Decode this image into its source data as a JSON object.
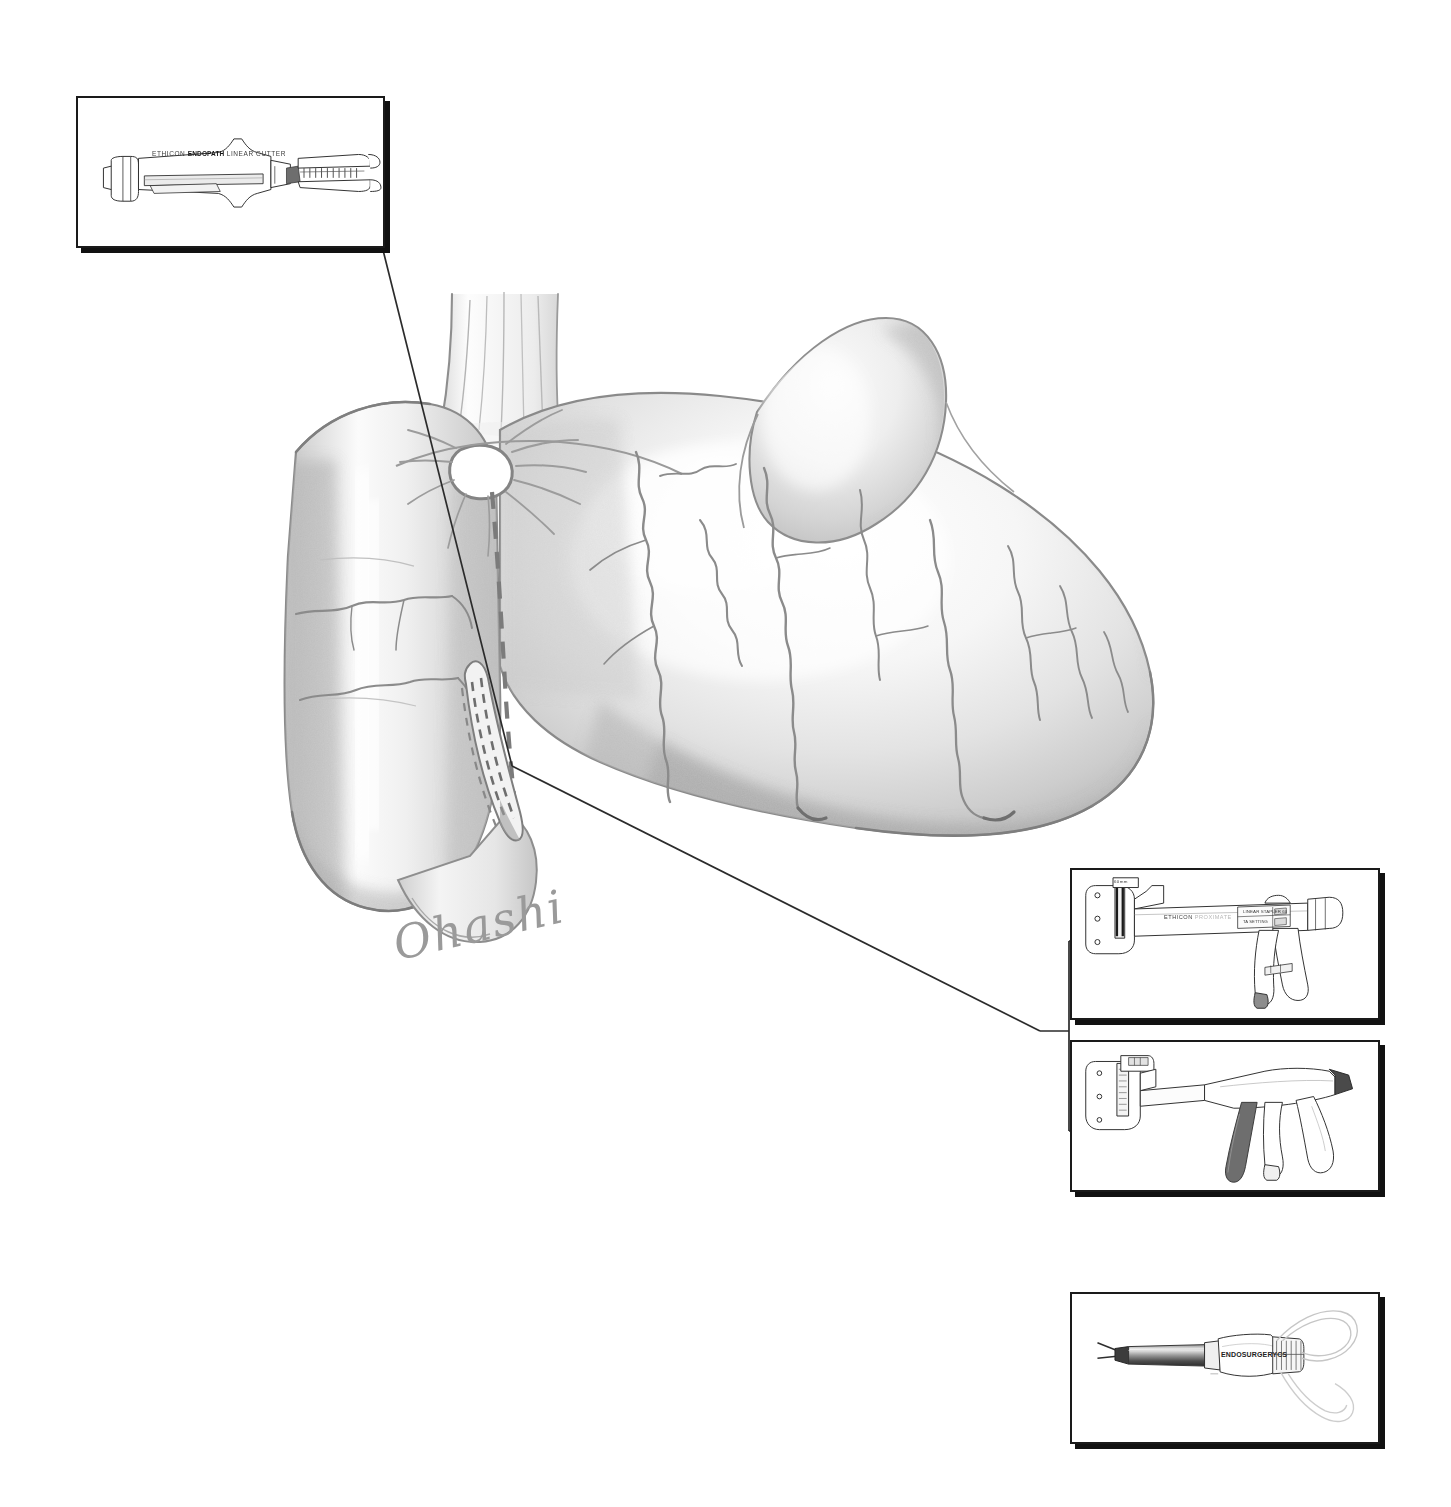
{
  "figure": {
    "background_color": "#ffffff",
    "ink_color": "#5a5a5a",
    "line_color": "#1a1a1a"
  },
  "anatomy": {
    "label": "anatomical-illustration",
    "structures": [
      {
        "name": "esophagus",
        "note": "longitudinal muscle striations entering cardia"
      },
      {
        "name": "gastric-conduit",
        "note": "tubularized lesser curvature limb, left"
      },
      {
        "name": "stoma-opening",
        "note": "circular anastomotic opening with radiating mucosal folds"
      },
      {
        "name": "stomach-body",
        "note": "greater curvature fundus and body, right"
      },
      {
        "name": "gastroepiploic-vessels",
        "note": "tortuous vessel arcade along greater curvature"
      },
      {
        "name": "staple-line",
        "note": "double parallel staple rows on divided margin"
      },
      {
        "name": "dashed-resection-line",
        "note": "dashed transection plane from cardia to antrum"
      },
      {
        "name": "duodenum",
        "note": "distal outflow segment"
      }
    ]
  },
  "signature": {
    "name": "artist-signature",
    "text": "Ohashi"
  },
  "insets": [
    {
      "id": "inset-linear-cutter",
      "name": "inset-linear-cutter",
      "position": "top-left",
      "x": 76,
      "y": 96,
      "width": 309,
      "height": 152,
      "device": "endoscopic-linear-cutter",
      "labels": {
        "brand": "ETHICON",
        "product": "ENDOPATH",
        "descriptor": "LINEAR CUTTER"
      }
    },
    {
      "id": "inset-linear-stapler",
      "name": "inset-linear-stapler",
      "position": "middle-right-upper",
      "x": 1070,
      "y": 868,
      "width": 310,
      "height": 152,
      "device": "linear-stapler-gun",
      "labels": {
        "brand": "ETHICON",
        "product": "PROXIMATE",
        "descriptor": "LINEAR STAPLER 60",
        "setting": "TA SETTING",
        "size_tick": "60mm"
      }
    },
    {
      "id": "inset-linear-stapler-alt",
      "name": "inset-linear-stapler-alt",
      "position": "middle-right-lower",
      "x": 1070,
      "y": 1040,
      "width": 310,
      "height": 152,
      "device": "linear-stapler-alternate-view",
      "labels": {}
    },
    {
      "id": "inset-circular-stapler",
      "name": "inset-circular-stapler",
      "position": "bottom-right",
      "x": 1070,
      "y": 1292,
      "width": 310,
      "height": 152,
      "device": "circular-stapler-shaft",
      "labels": {
        "brand": "ENDOSURGERY",
        "product": "CS"
      }
    }
  ],
  "leaders": [
    {
      "name": "leader-line-cutter",
      "from": "inset-linear-cutter",
      "to": "staple-line",
      "points": "383,248 512,765"
    },
    {
      "name": "leader-line-stapler",
      "from": "staple-line",
      "to": "stapler-bracket",
      "points": "512,765 1040,1030"
    },
    {
      "name": "stapler-bracket",
      "note": "square bracket joining the two stapler insets to one leader"
    }
  ]
}
